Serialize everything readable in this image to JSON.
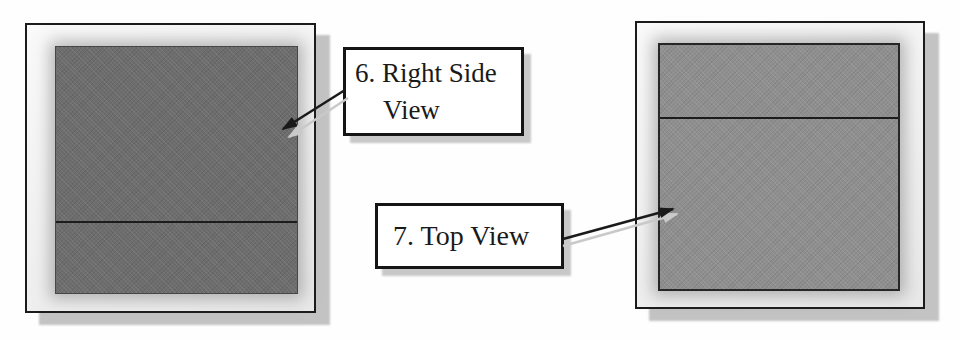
{
  "diagram": {
    "callouts": {
      "right_side_view": {
        "line1": "6. Right Side",
        "line2": "View"
      },
      "top_view": {
        "label": "7. Top View"
      }
    },
    "views": {
      "right_side": {
        "fill": "#6d6d6d",
        "divider_from_top_pct": 70.5
      },
      "top": {
        "fill": "#8f8f8f",
        "divider_from_top_pct": 29.5
      }
    },
    "colors": {
      "background": "#fefefe",
      "card_fill": "#f4f4f4",
      "card_border": "#1b1b1b",
      "card_shadow": "#c3c3c3",
      "left_square_fill": "#6d6d6d",
      "right_square_fill": "#8f8f8f",
      "divider_line": "#1c1c1c",
      "callout_fill": "#ffffff",
      "callout_border": "#151515",
      "callout_text": "#1a1a1a",
      "arrow": "#1a1a1a",
      "arrow_shadow": "#c9c9c9"
    }
  }
}
